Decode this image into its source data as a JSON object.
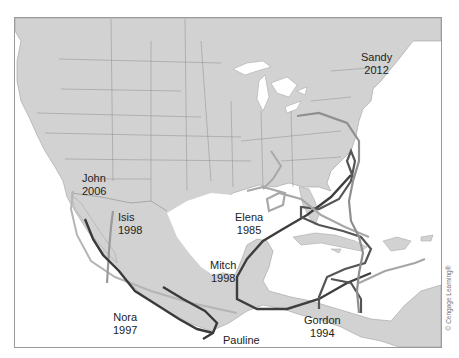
{
  "map": {
    "title": "",
    "land_color": "#d2d2d2",
    "water_color": "#ffffff",
    "border_color": "#8c8c8c",
    "frame_color": "#9a9a9a"
  },
  "hurricanes": [
    {
      "name": "Sandy",
      "year": "2012",
      "color": "#8f8f8f"
    },
    {
      "name": "John",
      "year": "2006",
      "color": "#b5b5b5"
    },
    {
      "name": "Isis",
      "year": "1998",
      "color": "#9a9a9a"
    },
    {
      "name": "Elena",
      "year": "1985",
      "color": "#a8a8a8"
    },
    {
      "name": "Mitch",
      "year": "1998",
      "color": "#3e3e3e"
    },
    {
      "name": "Nora",
      "year": "1997",
      "color": "#3a3a3a"
    },
    {
      "name": "Pauline",
      "year": "1997",
      "color": "#3a3a3a"
    },
    {
      "name": "Gordon",
      "year": "1994",
      "color": "#555555"
    }
  ],
  "credit": "© Cengage Learning®"
}
